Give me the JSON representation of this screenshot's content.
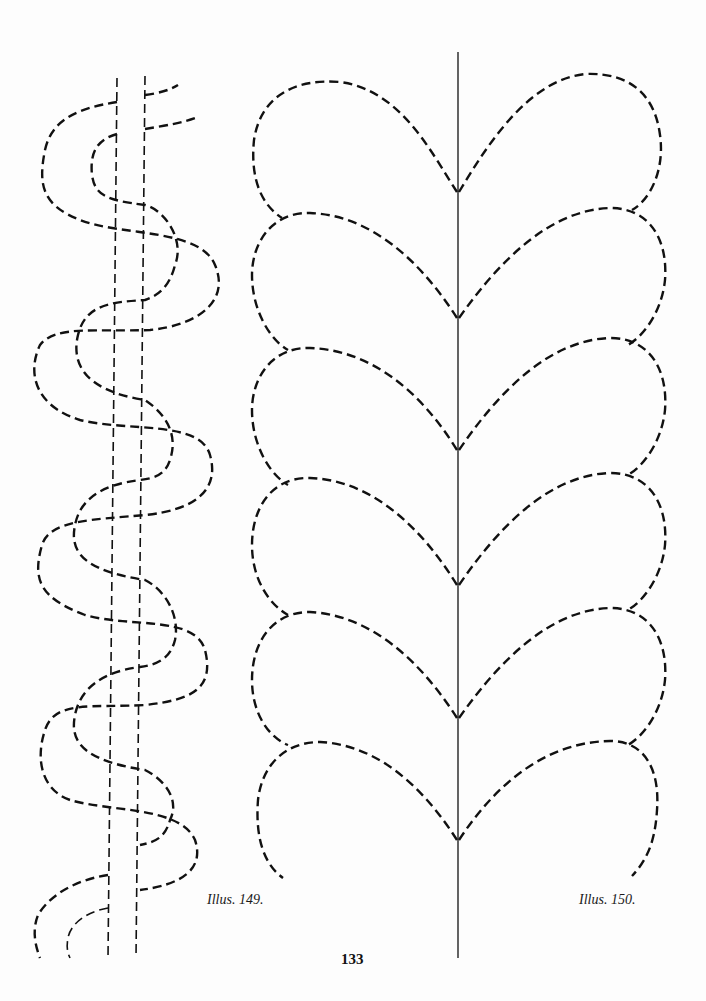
{
  "page": {
    "page_number": "133",
    "background": "#fdfdfd",
    "ink_color": "#111111"
  },
  "illustrations": [
    {
      "id": "149",
      "caption": "Illus. 149.",
      "description": "Serpentine cable pattern twisting around two parallel dashed lines"
    },
    {
      "id": "150",
      "caption": "Illus. 150.",
      "description": "Leaf/feather vine pattern with dashed leaves mirrored on either side of a solid central stem"
    }
  ]
}
